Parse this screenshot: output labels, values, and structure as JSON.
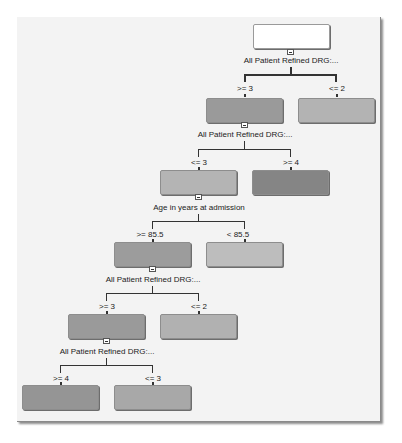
{
  "tree": {
    "root": {
      "fill": "#ffffff"
    },
    "levels": [
      {
        "split": "All Patient Refined DRG:...",
        "children": [
          {
            "condition": ">= 3",
            "fill": "#9a9a9a"
          },
          {
            "condition": "<= 2",
            "fill": "#b3b3b3"
          }
        ]
      },
      {
        "split": "All Patient Refined DRG:...",
        "children": [
          {
            "condition": "<= 3",
            "fill": "#b4b4b4"
          },
          {
            "condition": ">= 4",
            "fill": "#858585"
          }
        ]
      },
      {
        "split": "Age in years at admission",
        "children": [
          {
            "condition": ">=   85.5",
            "fill": "#9c9c9c"
          },
          {
            "condition": "<   85.5",
            "fill": "#bdbdbd"
          }
        ]
      },
      {
        "split": "All Patient Refined DRG:...",
        "children": [
          {
            "condition": ">= 3",
            "fill": "#9a9a9a"
          },
          {
            "condition": "<= 2",
            "fill": "#b1b1b1"
          }
        ]
      },
      {
        "split": "All Patient Refined DRG:...",
        "children": [
          {
            "condition": ">= 4",
            "fill": "#959595"
          },
          {
            "condition": "<= 3",
            "fill": "#a8a8a8"
          }
        ]
      }
    ]
  }
}
